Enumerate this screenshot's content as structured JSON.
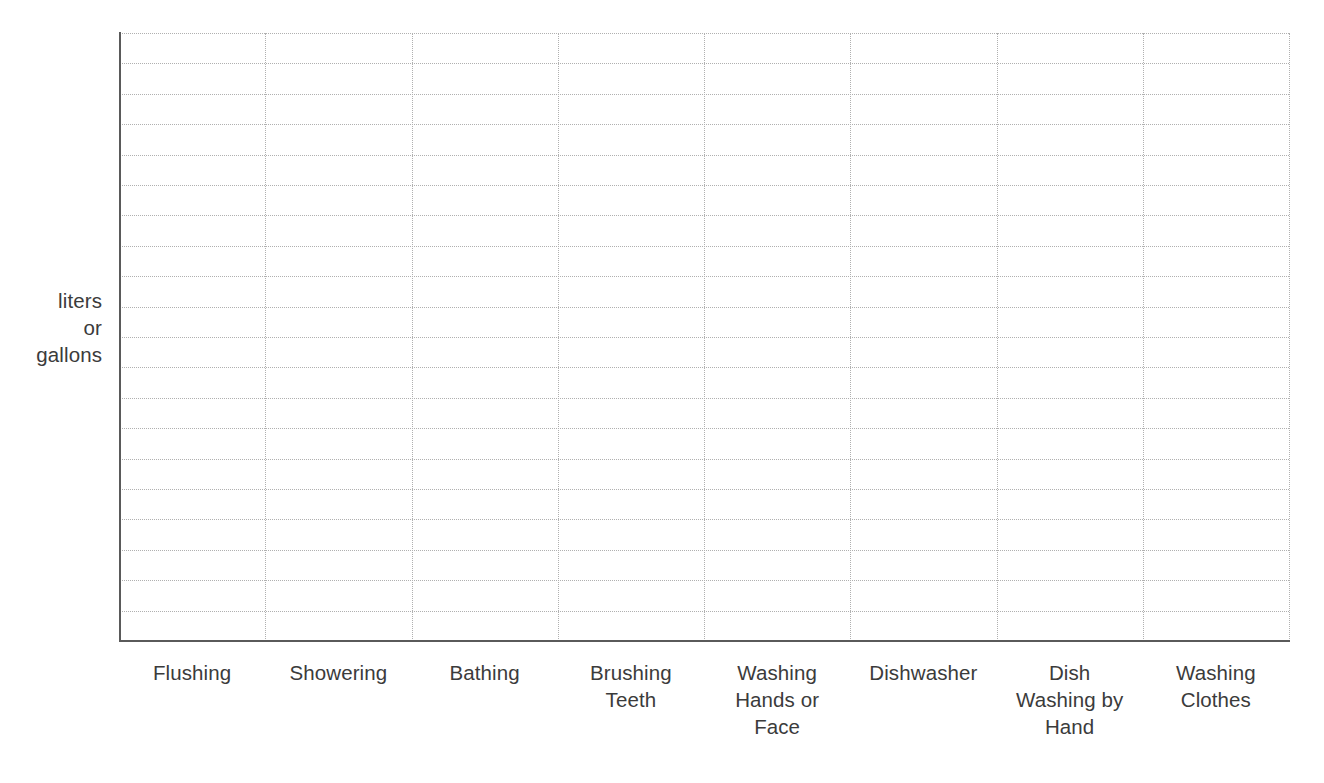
{
  "chart_data": {
    "type": "bar",
    "title": "",
    "xlabel": "",
    "ylabel": "liters\nor\ngallons",
    "categories": [
      "Flushing",
      "Showering",
      "Bathing",
      "Brushing\nTeeth",
      "Washing\nHands or\nFace",
      "Dishwasher",
      "Dish\nWashing by\nHand",
      "Washing\nClothes"
    ],
    "values": [
      null,
      null,
      null,
      null,
      null,
      null,
      null,
      null
    ],
    "grid": true,
    "grid_style": "dotted",
    "grid_columns": 8,
    "grid_rows": 20,
    "legend": "none",
    "ylim": [
      0,
      20
    ],
    "ytick_labels": [],
    "note": "blank worksheet grid - no data plotted",
    "colors": {
      "axis": "#5a5a5a",
      "gridline": "#b0b0b0",
      "text": "#3b3b3b",
      "background": "#ffffff"
    }
  },
  "axis": {
    "y_label_line1": "liters",
    "y_label_line2": "or",
    "y_label_line3": "gallons"
  }
}
